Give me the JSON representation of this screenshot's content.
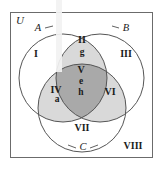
{
  "figure": {
    "type": "venn-diagram-3-set",
    "universe_label": "U",
    "background_color": "#ffffff",
    "frame_color": "#6b6b6b",
    "circle_stroke_color": "#555555",
    "text_color": "#1a1a1a",
    "shade_light": "#d9d9d9",
    "shade_medium": "#d2d2d2",
    "shade_dark": "#a9a9a9",
    "scan_streak_color": "#f0f0f0"
  },
  "sets": {
    "a": {
      "label": "A",
      "cx": 63,
      "cy": 78,
      "r": 44
    },
    "b": {
      "label": "B",
      "cx": 100,
      "cy": 78,
      "r": 44
    },
    "c": {
      "label": "C",
      "cx": 82,
      "cy": 108,
      "r": 44
    }
  },
  "set_label_positions": {
    "a": {
      "x": 38,
      "y": 29
    },
    "b": {
      "x": 126,
      "y": 29
    },
    "c": {
      "x": 83,
      "y": 148
    }
  },
  "regions": [
    {
      "id": "region-1",
      "label": "I",
      "x": 36,
      "y": 55,
      "shade": "none",
      "elements": []
    },
    {
      "id": "region-2",
      "label": "II",
      "x": 82,
      "y": 41,
      "shade": "light",
      "elements": [
        "g"
      ]
    },
    {
      "id": "region-3",
      "label": "III",
      "x": 126,
      "y": 55,
      "shade": "none",
      "elements": []
    },
    {
      "id": "region-4",
      "label": "IV",
      "x": 56,
      "y": 91,
      "shade": "light",
      "elements": [
        "a"
      ]
    },
    {
      "id": "region-5",
      "label": "V",
      "x": 81,
      "y": 71,
      "shade": "dark",
      "elements": [
        "e",
        "h"
      ]
    },
    {
      "id": "region-6",
      "label": "VI",
      "x": 110,
      "y": 93,
      "shade": "light",
      "elements": []
    },
    {
      "id": "region-7",
      "label": "VII",
      "x": 82,
      "y": 129,
      "shade": "none",
      "elements": []
    },
    {
      "id": "region-8",
      "label": "VIII",
      "x": 133,
      "y": 147,
      "shade": "none",
      "elements": []
    }
  ],
  "element_labels": [
    {
      "id": "elem-g",
      "text": "g",
      "x": 82,
      "y": 53
    },
    {
      "id": "elem-a",
      "text": "a",
      "x": 57,
      "y": 100
    },
    {
      "id": "elem-e",
      "text": "e",
      "x": 81,
      "y": 82
    },
    {
      "id": "elem-h",
      "text": "h",
      "x": 81,
      "y": 93
    }
  ]
}
